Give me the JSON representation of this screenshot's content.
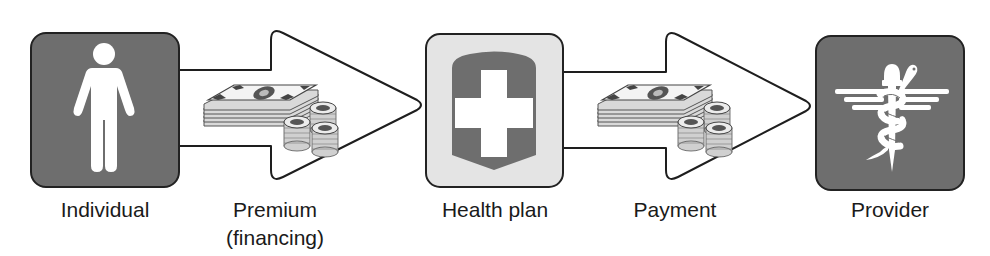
{
  "diagram": {
    "nodes": [
      {
        "id": "individual",
        "label": "Individual",
        "icon": "person-icon",
        "fill": "#6e6e6e"
      },
      {
        "id": "health_plan",
        "label": "Health plan",
        "icon": "shield-cross-icon",
        "fill": "#e4e4e4"
      },
      {
        "id": "provider",
        "label": "Provider",
        "icon": "caduceus-icon",
        "fill": "#6e6e6e"
      }
    ],
    "edges": [
      {
        "from": "individual",
        "to": "health_plan",
        "label_line1": "Premium",
        "label_line2": "(financing)",
        "icon": "money-icon"
      },
      {
        "from": "health_plan",
        "to": "provider",
        "label_line1": "Payment",
        "label_line2": "",
        "icon": "money-icon"
      }
    ]
  },
  "colors": {
    "dark_box": "#6e6e6e",
    "light_box": "#e4e4e4",
    "stroke": "#1e1e1e",
    "icon_white": "#ffffff",
    "arrow_fill": "#ffffff"
  }
}
